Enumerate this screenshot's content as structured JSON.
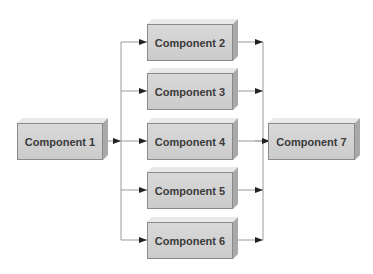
{
  "diagram": {
    "type": "component-flow",
    "nodes": [
      {
        "id": "c1",
        "label": "Component 1"
      },
      {
        "id": "c2",
        "label": "Component 2"
      },
      {
        "id": "c3",
        "label": "Component 3"
      },
      {
        "id": "c4",
        "label": "Component 4"
      },
      {
        "id": "c5",
        "label": "Component 5"
      },
      {
        "id": "c6",
        "label": "Component 6"
      },
      {
        "id": "c7",
        "label": "Component 7"
      }
    ],
    "edges": [
      {
        "from": "c1",
        "to": "c2"
      },
      {
        "from": "c1",
        "to": "c3"
      },
      {
        "from": "c1",
        "to": "c4"
      },
      {
        "from": "c1",
        "to": "c5"
      },
      {
        "from": "c1",
        "to": "c6"
      },
      {
        "from": "c2",
        "to": "c7"
      },
      {
        "from": "c3",
        "to": "c7"
      },
      {
        "from": "c4",
        "to": "c7"
      },
      {
        "from": "c5",
        "to": "c7"
      },
      {
        "from": "c6",
        "to": "c7"
      }
    ],
    "colors": {
      "box_fill": "#d0d0d0",
      "box_border": "#8a8a8a",
      "text": "#3a3a3a",
      "connector": "#9a9a9a",
      "arrowhead": "#222222"
    }
  }
}
